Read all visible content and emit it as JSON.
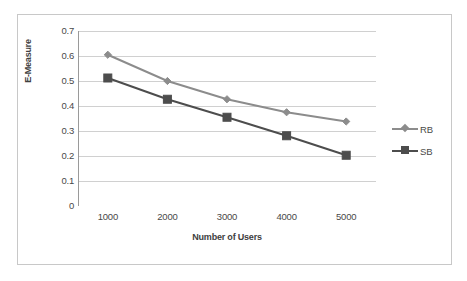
{
  "chart_data": {
    "type": "line",
    "title": "",
    "xlabel": "Number of Users",
    "ylabel": "E-Measure",
    "categories": [
      "1000",
      "2000",
      "3000",
      "4000",
      "5000"
    ],
    "x": [
      1000,
      2000,
      3000,
      4000,
      5000
    ],
    "ylim": [
      0,
      0.7
    ],
    "y_ticks": [
      "0",
      "0.1",
      "0.2",
      "0.3",
      "0.4",
      "0.5",
      "0.6",
      "0.7"
    ],
    "y_tick_values": [
      0,
      0.1,
      0.2,
      0.3,
      0.4,
      0.5,
      0.6,
      0.7
    ],
    "grid": "horizontal",
    "legend_position": "right",
    "series": [
      {
        "name": "RB",
        "marker": "diamond",
        "color": "#8c8c8c",
        "values": [
          0.605,
          0.5,
          0.427,
          0.375,
          0.338
        ]
      },
      {
        "name": "SB",
        "marker": "square",
        "color": "#4d4d4d",
        "values": [
          0.512,
          0.427,
          0.355,
          0.281,
          0.203
        ]
      }
    ]
  },
  "axes": {
    "y_title": "E-Measure",
    "x_title": "Number of Users"
  },
  "legend": {
    "items": [
      {
        "label": "RB"
      },
      {
        "label": "SB"
      }
    ]
  },
  "colors": {
    "series_rb": "#8c8c8c",
    "series_sb": "#4d4d4d",
    "gridline": "#d0d0d0",
    "axis": "#9a9a9a",
    "frame": "#c8c8c8",
    "text": "#494949"
  }
}
